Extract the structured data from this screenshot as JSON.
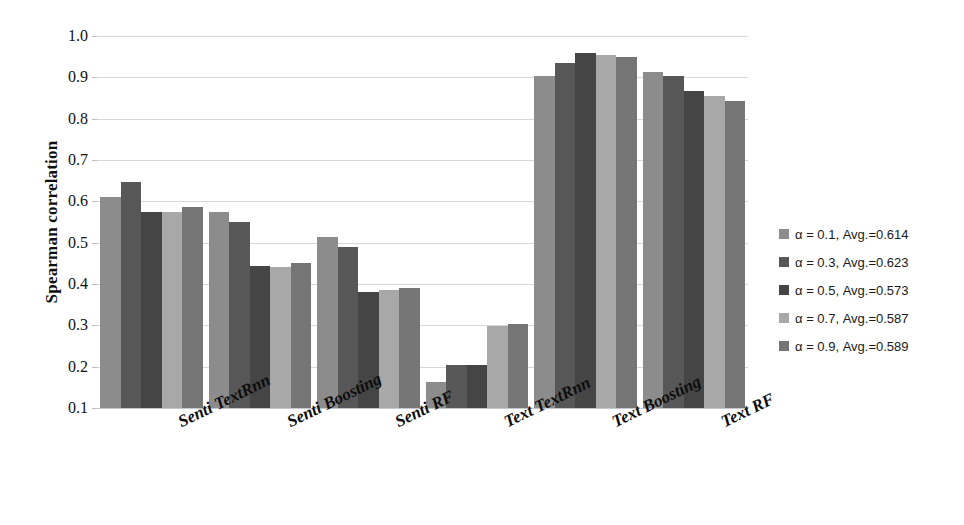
{
  "chart_data": {
    "type": "bar",
    "title": "",
    "subtitle": "",
    "xlabel": "",
    "ylabel": "Spearman correlation",
    "ylim": [
      0.1,
      1.0
    ],
    "ytick_labels": [
      "0.1",
      "0.2",
      "0.3",
      "0.4",
      "0.5",
      "0.6",
      "0.7",
      "0.8",
      "0.9",
      "1.0"
    ],
    "ytick_values": [
      0.1,
      0.2,
      0.3,
      0.4,
      0.5,
      0.6,
      0.7,
      0.8,
      0.9,
      1.0
    ],
    "grid": true,
    "legend_position": "right",
    "categories": [
      "Senti TextRnn",
      "Senti Boosting",
      "Senti RF",
      "Text TextRnn",
      "Text Boosting",
      "Text RF"
    ],
    "series": [
      {
        "name": "α = 0.1, Avg.=0.614",
        "alpha": "0.1",
        "average": "0.614",
        "color": "#8c8c8c",
        "values": [
          0.611,
          0.575,
          0.513,
          0.163,
          0.904,
          0.913
        ]
      },
      {
        "name": "α = 0.3, Avg.=0.623",
        "alpha": "0.3",
        "average": "0.623",
        "color": "#575757",
        "values": [
          0.648,
          0.551,
          0.489,
          0.205,
          0.935,
          0.903
        ]
      },
      {
        "name": "α = 0.5, Avg.=0.573",
        "alpha": "0.5",
        "average": "0.573",
        "color": "#454545",
        "values": [
          0.574,
          0.444,
          0.381,
          0.205,
          0.96,
          0.866
        ]
      },
      {
        "name": "α = 0.7, Avg.=0.587",
        "alpha": "0.7",
        "average": "0.587",
        "color": "#a8a8a8",
        "values": [
          0.574,
          0.44,
          0.385,
          0.299,
          0.953,
          0.855
        ]
      },
      {
        "name": "α = 0.9, Avg.=0.589",
        "alpha": "0.9",
        "average": "0.589",
        "color": "#757575",
        "values": [
          0.587,
          0.452,
          0.39,
          0.303,
          0.95,
          0.842
        ]
      }
    ]
  }
}
